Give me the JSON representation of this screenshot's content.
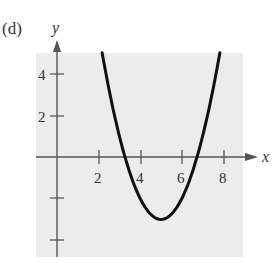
{
  "panel_label": "(d)",
  "chart_data": {
    "type": "line",
    "title": "",
    "function": "f(x) = (x - 5)^2 - 3",
    "xlabel": "x",
    "ylabel": "y",
    "xlim": [
      -1,
      8.7
    ],
    "ylim": [
      -4.8,
      5
    ],
    "x_ticks": [
      2,
      4,
      6,
      8
    ],
    "x_tick_labels": [
      "2",
      "4",
      "6",
      "8"
    ],
    "y_ticks": [
      4,
      2,
      -2,
      -4
    ],
    "y_tick_labels": [
      "4",
      "2",
      "",
      ""
    ],
    "grid": false,
    "legend": null,
    "series": [
      {
        "name": "parabola",
        "x": [
          2.17,
          2.5,
          3,
          3.5,
          4,
          4.5,
          5,
          5.5,
          6,
          6.5,
          7,
          7.5,
          7.83
        ],
        "values": [
          5,
          3.25,
          1,
          -0.75,
          -2,
          -2.75,
          -3,
          -2.75,
          -2,
          -0.75,
          1,
          3.25,
          5
        ]
      }
    ],
    "vertex": [
      5,
      -3
    ],
    "x_intercepts": [
      3.27,
      6.73
    ],
    "colors": {
      "background_panel": "#ececec",
      "curve": "#111111",
      "axes": "#555555"
    }
  }
}
